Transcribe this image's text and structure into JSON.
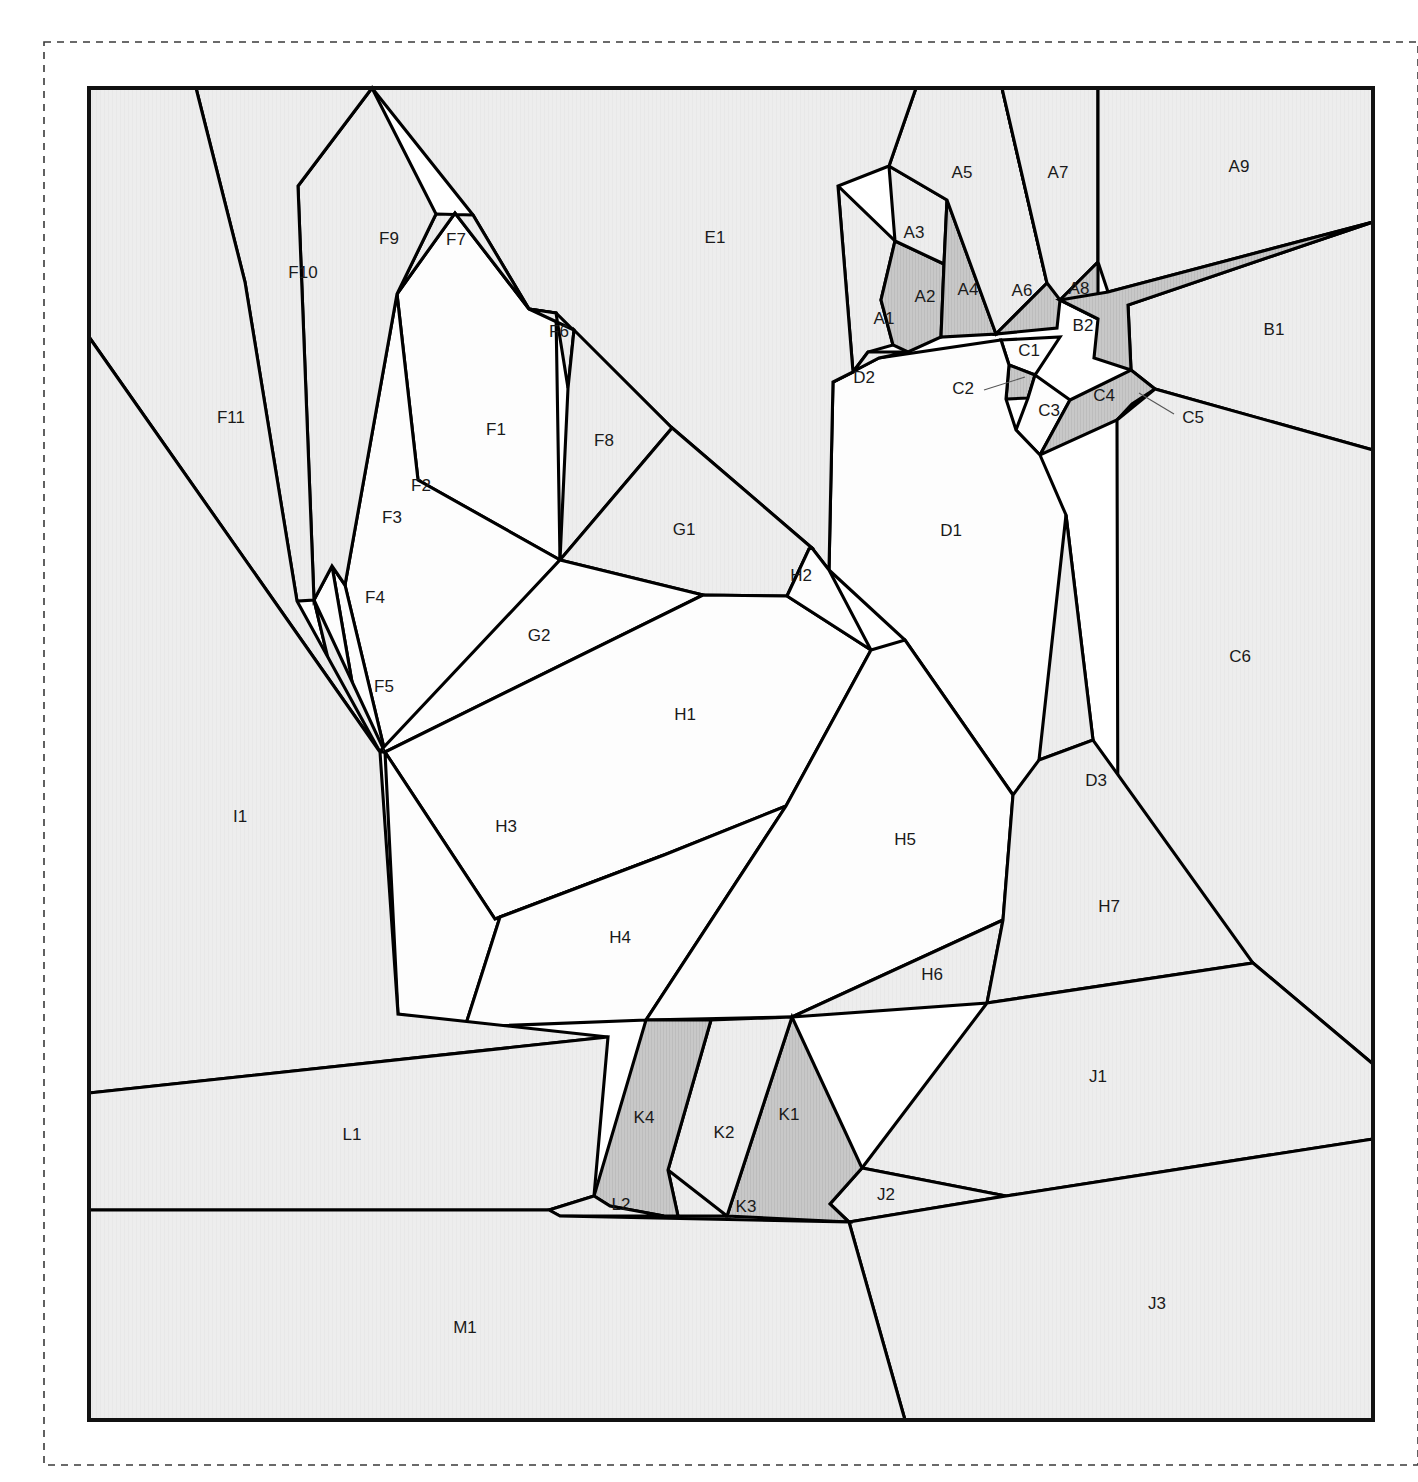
{
  "figure": {
    "kind": "sector-partition-diagram",
    "width": 1418,
    "height": 1482,
    "frame": {
      "x": 89,
      "y": 88,
      "width": 1284,
      "height": 1332
    },
    "dashed_border": {
      "x": 44,
      "y": 42,
      "width": 1374,
      "height": 1423
    }
  },
  "colors": {
    "background": "#ffffff",
    "plain_fill": "#ededed",
    "white_fill": "#fdfdfd",
    "shaded_fill": "#c8c8c8",
    "outline": "#000000",
    "label_text": "#1a1a1a",
    "leader_line": "#555555",
    "frame_stroke": "#111111",
    "dashed_stroke": "#3a3a3a"
  },
  "legend_note": "",
  "regions": [
    {
      "id": "A1",
      "label": "A1",
      "fill": "plain",
      "label_pos": [
        884,
        320
      ],
      "points": "868,352 853,372 838,186 895,241 881,300 893,345"
    },
    {
      "id": "A2",
      "label": "A2",
      "fill": "shaded",
      "label_pos": [
        925,
        298
      ],
      "points": "895,241 944,264 941,337 908,352 893,345 881,300"
    },
    {
      "id": "A3",
      "label": "A3",
      "fill": "plain",
      "label_pos": [
        914,
        234
      ],
      "points": "895,241 889,166 947,200 944,264"
    },
    {
      "id": "A4",
      "label": "A4",
      "fill": "shaded",
      "label_pos": [
        968,
        291
      ],
      "points": "947,200 996,334 941,337 944,264"
    },
    {
      "id": "A5",
      "label": "A5",
      "fill": "plain",
      "label_pos": [
        962,
        174
      ],
      "points": "889,166 916,88 1002,88 1047,283 996,334 947,200"
    },
    {
      "id": "A6",
      "label": "A6",
      "fill": "shaded",
      "label_pos": [
        1022,
        292
      ],
      "points": "1002,88 1047,283 996,334 1057,328 1060,300"
    },
    {
      "id": "A7",
      "label": "A7",
      "fill": "plain",
      "label_pos": [
        1058,
        174
      ],
      "points": "1002,88 1098,88 1098,262 1060,300 1047,283"
    },
    {
      "id": "A8",
      "label": "A8",
      "fill": "shaded",
      "label_pos": [
        1079,
        290
      ],
      "points": "1098,262 1098,319 1060,300"
    },
    {
      "id": "A9",
      "label": "A9",
      "fill": "plain",
      "label_pos": [
        1239,
        168
      ],
      "points": "1098,88 1373,88 1373,222 1108,292 1098,262"
    },
    {
      "id": "B1",
      "label": "B1",
      "fill": "plain",
      "label_pos": [
        1274,
        331
      ],
      "points": "1373,222 1373,450 1155,389 1131,370 1128,305"
    },
    {
      "id": "B2",
      "label": "B2",
      "fill": "shaded",
      "label_pos": [
        1083,
        327
      ],
      "points": "1098,319 1060,300 1108,292 1373,222 1128,305 1131,370 1094,358"
    },
    {
      "id": "C1",
      "label": "C1",
      "fill": "white",
      "label_pos": [
        1029,
        352
      ],
      "points": "1001,340 1060,337 1035,375 1009,365"
    },
    {
      "id": "C2",
      "label": "C2",
      "fill": "shaded",
      "label_pos": [
        963,
        390
      ],
      "points": "1009,365 1035,375 1028,398 1006,399",
      "leader": {
        "from": [
          984,
          390
        ],
        "to": [
          1025,
          377
        ]
      }
    },
    {
      "id": "C3",
      "label": "C3",
      "fill": "white",
      "label_pos": [
        1049,
        412
      ],
      "points": "1035,375 1070,400 1040,455 1016,430 1028,398"
    },
    {
      "id": "C4",
      "label": "C4",
      "fill": "shaded",
      "label_pos": [
        1104,
        397
      ],
      "points": "1070,400 1131,370 1155,389 1117,420 1040,455"
    },
    {
      "id": "C5",
      "label": "C5",
      "fill": "plain",
      "label_pos": [
        1193,
        419
      ],
      "points": "1155,389 1132,404 1117,420",
      "leader": {
        "from": [
          1174,
          414
        ],
        "to": [
          1139,
          393
        ]
      }
    },
    {
      "id": "C6",
      "label": "C6",
      "fill": "plain",
      "label_pos": [
        1240,
        658
      ],
      "points": "1373,450 1373,1064 1253,963 1118,883 1117,420 1155,389"
    },
    {
      "id": "D1",
      "label": "D1",
      "fill": "white",
      "label_pos": [
        951,
        532
      ],
      "points": "1001,340 1009,365 1006,399 1016,430 1040,455 1066,515 1093,740 1013,795 905,640 829,570 833,382 879,358"
    },
    {
      "id": "D2",
      "label": "D2",
      "fill": "plain",
      "label_pos": [
        864,
        379
      ],
      "points": "853,372 868,352 908,352 879,358 833,382"
    },
    {
      "id": "D3",
      "label": "D3",
      "fill": "plain",
      "label_pos": [
        1096,
        782
      ],
      "points": "1066,515 1093,740 1039,760"
    },
    {
      "id": "E1",
      "label": "E1",
      "fill": "plain",
      "label_pos": [
        715,
        239
      ],
      "points": "372,88 916,88 889,166 838,186 853,372 833,382 829,570 812,548 671,427 556,313 529,309 473,215"
    },
    {
      "id": "F1",
      "label": "F1",
      "fill": "white",
      "label_pos": [
        496,
        431
      ],
      "points": "397,294 455,213 529,309 556,313 560,560 418,480"
    },
    {
      "id": "F2",
      "label": "F2",
      "fill": "white",
      "label_pos": [
        421,
        487
      ],
      "points": "397,294 418,480 560,560 385,752 345,585"
    },
    {
      "id": "F3",
      "label": "F3",
      "fill": "white",
      "label_pos": [
        392,
        519
      ],
      "points": "345,585 385,752 363,746 332,566"
    },
    {
      "id": "F4",
      "label": "F4",
      "fill": "white",
      "label_pos": [
        375,
        599
      ],
      "points": "332,566 363,746 350,750 314,600"
    },
    {
      "id": "F5",
      "label": "F5",
      "fill": "plain",
      "label_pos": [
        384,
        688
      ],
      "points": "314,600 350,750 380,752 383,748"
    },
    {
      "id": "F6",
      "label": "F6",
      "fill": "plain",
      "label_pos": [
        559,
        333
      ],
      "points": "529,309 574,330 568,388 556,313"
    },
    {
      "id": "F7",
      "label": "F7",
      "fill": "plain",
      "label_pos": [
        456,
        241
      ],
      "points": "436,214 473,215 529,309 455,213 397,294"
    },
    {
      "id": "F8",
      "label": "F8",
      "fill": "plain",
      "label_pos": [
        604,
        442
      ],
      "points": "574,330 671,427 672,428 560,560 568,388"
    },
    {
      "id": "F9",
      "label": "F9",
      "fill": "plain",
      "label_pos": [
        389,
        240
      ],
      "points": "372,88 436,214 397,294 345,585 332,566 314,600 298,186"
    },
    {
      "id": "F10",
      "label": "F10",
      "fill": "plain",
      "label_pos": [
        303,
        274
      ],
      "points": "196,88 372,88 298,186 314,600 297,601 245,282"
    },
    {
      "id": "F11",
      "label": "F11",
      "fill": "plain",
      "label_pos": [
        231,
        419
      ],
      "points": "196,88 245,282 297,601 380,752 89,337 89,88"
    },
    {
      "id": "G1",
      "label": "G1",
      "fill": "plain",
      "label_pos": [
        684,
        531
      ],
      "points": "671,427 812,548 809,549 787,596 703,595 560,560 672,428"
    },
    {
      "id": "G2",
      "label": "G2",
      "fill": "white",
      "label_pos": [
        539,
        637
      ],
      "points": "560,560 703,595 385,752 380,752 383,748"
    },
    {
      "id": "H1",
      "label": "H1",
      "fill": "white",
      "label_pos": [
        685,
        716
      ],
      "points": "703,595 787,596 871,650 786,806 664,855 495,919 385,752"
    },
    {
      "id": "H2",
      "label": "H2",
      "fill": "white",
      "label_pos": [
        801,
        577
      ],
      "points": "787,596 809,549 812,548 829,570 871,650"
    },
    {
      "id": "H3",
      "label": "H3",
      "fill": "white",
      "label_pos": [
        506,
        828
      ],
      "points": "385,752 495,919 664,855 500,917 465,1027 398,1014"
    },
    {
      "id": "H4",
      "label": "H4",
      "fill": "white",
      "label_pos": [
        620,
        939
      ],
      "points": "500,917 664,855 786,806 646,1020 465,1027"
    },
    {
      "id": "H5",
      "label": "H5",
      "fill": "white",
      "label_pos": [
        905,
        841
      ],
      "points": "871,650 905,640 1013,795 1003,920 792,1017 646,1020 786,806"
    },
    {
      "id": "H6",
      "label": "H6",
      "fill": "plain",
      "label_pos": [
        932,
        976
      ],
      "points": "1003,920 987,1003 792,1017"
    },
    {
      "id": "H7",
      "label": "H7",
      "fill": "plain",
      "label_pos": [
        1109,
        908
      ],
      "points": "1013,795 1039,760 1093,740 1253,963 987,1003 1003,920"
    },
    {
      "id": "I1",
      "label": "I1",
      "fill": "plain",
      "label_pos": [
        240,
        818
      ],
      "points": "89,337 380,752 398,1014 608,1037 89,1093"
    },
    {
      "id": "J1",
      "label": "J1",
      "fill": "plain",
      "label_pos": [
        1098,
        1078
      ],
      "points": "1253,963 1373,1064 1373,1139 1006,1196 862,1168 987,1003"
    },
    {
      "id": "J2",
      "label": "J2",
      "fill": "plain",
      "label_pos": [
        886,
        1196
      ],
      "points": "862,1168 1006,1196 849,1222 830,1204"
    },
    {
      "id": "J3",
      "label": "J3",
      "fill": "plain",
      "label_pos": [
        1157,
        1305
      ],
      "points": "849,1222 1006,1196 1373,1139 1373,1420 905,1420"
    },
    {
      "id": "K1",
      "label": "K1",
      "fill": "shaded",
      "label_pos": [
        789,
        1116
      ],
      "points": "792,1017 862,1168 830,1204 849,1222 727,1216"
    },
    {
      "id": "K2",
      "label": "K2",
      "fill": "plain",
      "label_pos": [
        724,
        1134
      ],
      "points": "711,1020 792,1017 727,1216 678,1216 668,1170"
    },
    {
      "id": "K3",
      "label": "K3",
      "fill": "plain",
      "label_pos": [
        746,
        1208
      ],
      "points": "668,1170 727,1216 678,1216"
    },
    {
      "id": "K4",
      "label": "K4",
      "fill": "shaded",
      "label_pos": [
        644,
        1119
      ],
      "points": "646,1020 711,1020 668,1170 678,1216 664,1216 610,1206 594,1196"
    },
    {
      "id": "L1",
      "label": "L1",
      "fill": "plain",
      "label_pos": [
        352,
        1136
      ],
      "points": "89,1093 608,1037 594,1196 549,1210 89,1210"
    },
    {
      "id": "L2",
      "label": "L2",
      "fill": "plain",
      "label_pos": [
        621,
        1206
      ],
      "points": "549,1210 594,1196 610,1206 664,1216 560,1216"
    },
    {
      "id": "M1",
      "label": "M1",
      "fill": "plain",
      "label_pos": [
        465,
        1329
      ],
      "points": "89,1210 549,1210 560,1216 849,1222 905,1420 89,1420"
    }
  ]
}
